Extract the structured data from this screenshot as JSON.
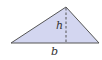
{
  "diagram": {
    "title": "",
    "shape": "triangle",
    "fill_color": "#d3d6f0",
    "stroke_color": "#555555",
    "altitude_color": "#555555",
    "labels": {
      "height": "h",
      "base": "b"
    }
  }
}
